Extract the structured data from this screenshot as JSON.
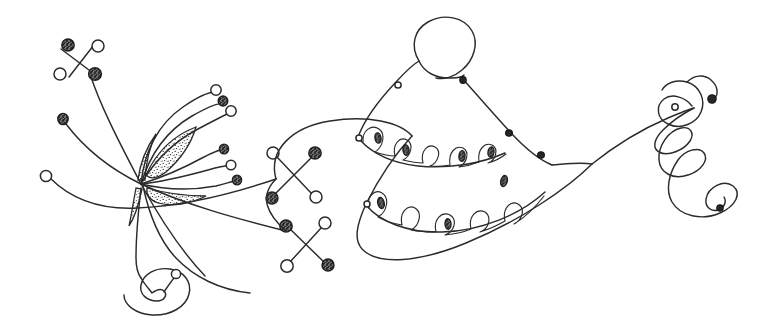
{
  "canvas": {
    "width": 783,
    "height": 334,
    "background_color": "#ffffff",
    "ink_color": "#2b2b2b",
    "title": "Abstract hand-drawn line illustration"
  },
  "style": {
    "stroke_color": "#2b2b2b",
    "stroke_width_main": 1.45,
    "stroke_width_thin": 1.15,
    "node_fill_open": "#ffffff",
    "node_fill_solid": "#262626",
    "stipple_color": "#3a3a3a"
  },
  "artwork": {
    "description": "Freehand pen drawing of a fan of curved tendrils on the left converging at a hub with four stippled curvilinear triangles, a large bell or cone form with scalloped looping bands at center-right, and a descending coil flourish at the right edge.",
    "regions": [
      {
        "name": "tendril-fan",
        "label": "Left tendril fan"
      },
      {
        "name": "stipple-hub",
        "label": "Stippled wedge hub"
      },
      {
        "name": "jack-cluster",
        "label": "X-shaped jack markers"
      },
      {
        "name": "bell-form",
        "label": "Bell with scalloped bands"
      },
      {
        "name": "coil-flourish",
        "label": "Right coil flourish"
      },
      {
        "name": "lower-spiral",
        "label": "Lower left spiral"
      }
    ]
  },
  "elements": {
    "jacks": [
      {
        "name": "jack-upper-left",
        "cx": 86,
        "cy": 58
      },
      {
        "name": "jack-center",
        "cx": 293,
        "cy": 182
      },
      {
        "name": "jack-lower",
        "cx": 305,
        "cy": 243
      }
    ],
    "terminal_nodes": [
      {
        "name": "node-open-left",
        "cx": 46,
        "cy": 176,
        "kind": "open"
      },
      {
        "name": "node-speckled-left",
        "cx": 63,
        "cy": 119,
        "kind": "speckled"
      },
      {
        "name": "node-open-upper",
        "cx": 214,
        "cy": 89,
        "kind": "open"
      },
      {
        "name": "node-speckled-upper",
        "cx": 222,
        "cy": 101,
        "kind": "speckled"
      },
      {
        "name": "node-open-upper-2",
        "cx": 229,
        "cy": 110,
        "kind": "open"
      },
      {
        "name": "node-speckled-mid",
        "cx": 222,
        "cy": 148,
        "kind": "speckled"
      },
      {
        "name": "node-open-mid",
        "cx": 230,
        "cy": 165,
        "kind": "open"
      },
      {
        "name": "node-speckled-mid-2",
        "cx": 236,
        "cy": 180,
        "kind": "speckled"
      },
      {
        "name": "node-open-spiral-tail",
        "cx": 172,
        "cy": 274,
        "kind": "open"
      },
      {
        "name": "node-filled-coil",
        "cx": 711,
        "cy": 99,
        "kind": "filled"
      },
      {
        "name": "node-open-coil",
        "cx": 677,
        "cy": 105,
        "kind": "open"
      },
      {
        "name": "node-filled-coil-inner",
        "cx": 713,
        "cy": 208,
        "kind": "filled"
      }
    ],
    "wedges": [
      {
        "name": "wedge-upper-left",
        "label": "stippled wedge upper left"
      },
      {
        "name": "wedge-upper-right",
        "label": "stippled wedge upper right"
      },
      {
        "name": "wedge-lower-left",
        "label": "stippled wedge lower left"
      },
      {
        "name": "wedge-lower-right",
        "label": "stippled wedge lower right"
      }
    ],
    "scallop_bands": [
      {
        "name": "band-upper",
        "loop_count": 7
      },
      {
        "name": "band-lower",
        "loop_count": 7
      }
    ]
  }
}
